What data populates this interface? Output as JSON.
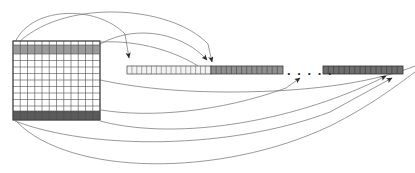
{
  "figure": {
    "background_color": "#ffffff",
    "line_color": "#6b6b6b",
    "grid_line_color": "#4d4d4d",
    "arrow_color": "#2b2b2b"
  },
  "matrix": {
    "name": "source-matrix",
    "x": 13,
    "y": 41,
    "width": 87,
    "height": 79,
    "columns": 12,
    "rows": 12,
    "cell_fill": "#ffffff",
    "border_color": "#4a4a4a",
    "highlight_rows": [
      {
        "index": 0,
        "label": "first-row",
        "fill": "#9a9a9a",
        "y": 45,
        "height": 9
      },
      {
        "index": 11,
        "label": "last-row",
        "fill": "#5a5a5a",
        "y": 111,
        "height": 9
      }
    ]
  },
  "vectors": [
    {
      "name": "first-row-vector",
      "x": 127,
      "y": 66,
      "width": 84,
      "height": 8,
      "cells": 17,
      "fill": "#f2f2f2",
      "border_color": "#555555"
    },
    {
      "name": "second-row-vector",
      "x": 211,
      "y": 66,
      "width": 72,
      "height": 8,
      "cells": 14,
      "fill": "#8f8f8f",
      "border_color": "#3a3a3a"
    },
    {
      "name": "last-row-vector",
      "x": 323,
      "y": 66,
      "width": 80,
      "height": 8,
      "cells": 15,
      "fill": "#6e6e6e",
      "border_color": "#2f2f2f"
    }
  ],
  "ellipsis": {
    "name": "continuation-ellipsis",
    "text": ". . . . .",
    "x": 287,
    "y": 64
  },
  "connectors": [
    {
      "name": "connector-top-row-to-vector-1",
      "from": "matrix-top-left",
      "to": "vector-1-left",
      "arrow": true
    },
    {
      "name": "connector-top-row-to-vector-2",
      "from": "matrix-top-left",
      "to": "vector-2-left",
      "arrow": true
    },
    {
      "name": "connector-mid-to-vector-2",
      "from": "matrix-left",
      "to": "vector-2-left",
      "arrow": true
    },
    {
      "name": "connector-bottom-row-to-last-vector",
      "from": "matrix-bottom-left",
      "to": "last-vector-right",
      "arrow": true
    },
    {
      "name": "connector-bottom-row-to-last-vector-alt",
      "from": "matrix-bottom-left",
      "to": "last-vector-right",
      "arrow": true
    },
    {
      "name": "connector-bottom-row-to-gap",
      "from": "matrix-bottom-left",
      "to": "ellipsis-region",
      "arrow": true
    }
  ]
}
